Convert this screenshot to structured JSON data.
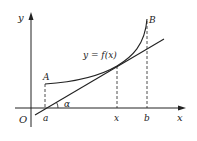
{
  "diagram": {
    "type": "function-tangent-diagram",
    "axes": {
      "x_label": "x",
      "y_label": "y",
      "origin_label": "O"
    },
    "curve": {
      "label": "y = f(x)",
      "start_point_label": "A",
      "end_point_label": "B"
    },
    "tangent": {
      "angle_label": "α"
    },
    "x_ticks": [
      {
        "label": "a"
      },
      {
        "label": "x"
      },
      {
        "label": "b"
      }
    ],
    "colors": {
      "stroke": "#222222",
      "background": "#ffffff"
    }
  }
}
